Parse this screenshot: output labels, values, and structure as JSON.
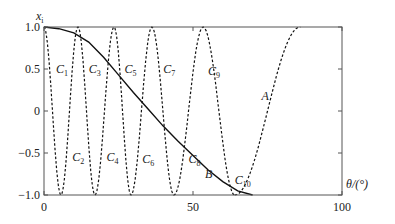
{
  "chart_data": {
    "type": "line",
    "title": "",
    "xlabel": "θ/(°)",
    "ylabel": "x_i",
    "xlim": [
      0,
      100
    ],
    "ylim": [
      -1.0,
      1.0
    ],
    "xticks": [
      "0",
      "50",
      "100"
    ],
    "yticks": [
      "1.0",
      "0.5",
      "0",
      "-0.5",
      "-1.0"
    ],
    "grid": false,
    "legend": "none (inline curve labels)",
    "series": [
      {
        "name": "A",
        "style": "dashed",
        "x": [
          0,
          10,
          20,
          30,
          40,
          50,
          55,
          60,
          64,
          68,
          72,
          76,
          80,
          84,
          86
        ],
        "y": [
          1,
          1,
          1,
          1,
          1,
          1,
          1,
          1,
          -1,
          -0.7,
          -0.1,
          0.45,
          0.82,
          0.99,
          1.0
        ]
      },
      {
        "name": "B",
        "style": "solid",
        "x": [
          0,
          5,
          10,
          15,
          20,
          25,
          30,
          35,
          40,
          45,
          50,
          55,
          60,
          65,
          70
        ],
        "y": [
          1,
          0.98,
          0.93,
          0.82,
          0.64,
          0.43,
          0.22,
          0.02,
          -0.18,
          -0.36,
          -0.53,
          -0.7,
          -0.84,
          -0.95,
          -1.0
        ]
      },
      {
        "name": "C",
        "style": "dashed",
        "peaks_x": [
          0,
          11.4,
          23.5,
          36.2,
          53.4
        ],
        "troughs_x": [
          5.7,
          17.1,
          29.2,
          43.6,
          64.0
        ]
      }
    ],
    "annotations": [
      {
        "text": "C",
        "sub": "1",
        "x": 4,
        "y": 0.5
      },
      {
        "text": "C",
        "sub": "2",
        "x": 9.5,
        "y": -0.55
      },
      {
        "text": "C",
        "sub": "3",
        "x": 15,
        "y": 0.5
      },
      {
        "text": "C",
        "sub": "4",
        "x": 21,
        "y": -0.55
      },
      {
        "text": "C",
        "sub": "5",
        "x": 27,
        "y": 0.5
      },
      {
        "text": "C",
        "sub": "6",
        "x": 33,
        "y": -0.57
      },
      {
        "text": "C",
        "sub": "7",
        "x": 40,
        "y": 0.5
      },
      {
        "text": "C",
        "sub": "8",
        "x": 48.5,
        "y": -0.57
      },
      {
        "text": "C",
        "sub": "9",
        "x": 55,
        "y": 0.48
      },
      {
        "text": "C",
        "sub": "10",
        "x": 64,
        "y": -0.82
      },
      {
        "text": "B",
        "sub": "",
        "x": 54,
        "y": -0.75
      },
      {
        "text": "A",
        "sub": "",
        "x": 73,
        "y": 0.18
      }
    ]
  }
}
